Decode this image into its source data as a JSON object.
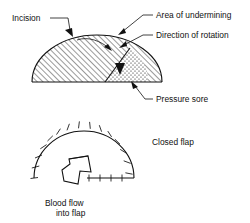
{
  "figure": {
    "line_color": "#111111",
    "background": "#ffffff"
  },
  "labels": {
    "incision": "Incision",
    "area_of_undermining": "Area of undermining",
    "direction_of_rotation": "Direction of rotation",
    "pressure_sore": "Pressure sore",
    "closed_flap": "Closed flap",
    "blood_flow_line1": "Blood flow",
    "blood_flow_line2": "into flap"
  },
  "top_figure": {
    "name": "rotation-flap-design",
    "flap_fill": "diagonal-hatch",
    "sore_fill": "stipple",
    "baseline_y": 82,
    "dome_center_x": 97,
    "dome_radius_x": 65,
    "dome_radius_y": 47
  },
  "bottom_figure": {
    "name": "closed-flap-result",
    "arc_suture_count": 12,
    "line_suture_count": 4,
    "arc_center_x": 84,
    "arc_center_y": 178,
    "arc_radius_x": 50,
    "arc_radius_y": 47
  }
}
